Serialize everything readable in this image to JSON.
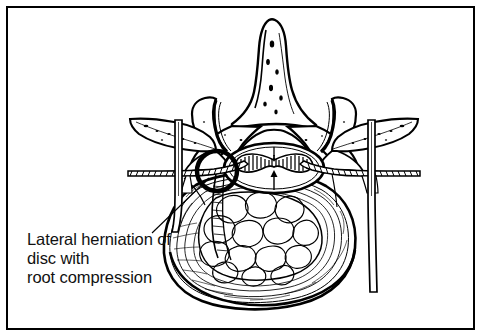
{
  "figure": {
    "domain": "medical-illustration",
    "background_color": "#ffffff",
    "ink_color": "#000000",
    "frame": {
      "present": true,
      "stroke_color": "#000000",
      "stroke_width": 2,
      "x": 7,
      "y": 7,
      "width": 467,
      "height": 322
    }
  },
  "annotation": {
    "label_lines": [
      "Lateral herniation of",
      "disc with",
      "root compression"
    ],
    "text_color": "#111111",
    "font_size_px": 16.5,
    "line_height_px": 19,
    "text_origin": {
      "x": 27,
      "y": 245
    },
    "leader_line": {
      "from": {
        "x": 152,
        "y": 233
      },
      "to": {
        "x": 209,
        "y": 178
      },
      "stroke_color": "#000000",
      "stroke_width": 1.1
    },
    "highlight_circle": {
      "center": {
        "x": 217,
        "y": 171
      },
      "radius": 20,
      "stroke_color": "#000000",
      "stroke_width": 4.5,
      "fill": "none",
      "marks": "lateral-herniation-site"
    }
  },
  "anatomy": {
    "parts": [
      {
        "name": "spinous-process",
        "label": "Spinous process",
        "position": "posterior-midline-top"
      },
      {
        "name": "lamina",
        "label": "Lamina",
        "position": "posterior-paired"
      },
      {
        "name": "superior-articular-process-left",
        "label": "Superior articular process (left)",
        "position": "posterolateral-left"
      },
      {
        "name": "superior-articular-process-right",
        "label": "Superior articular process (right)",
        "position": "posterolateral-right"
      },
      {
        "name": "transverse-process-left",
        "label": "Transverse process (left)",
        "position": "lateral-left"
      },
      {
        "name": "transverse-process-right",
        "label": "Transverse process (right)",
        "position": "lateral-right"
      },
      {
        "name": "pedicle-left",
        "label": "Pedicle (left)",
        "position": "lateral-canal-left"
      },
      {
        "name": "pedicle-right",
        "label": "Pedicle (right)",
        "position": "lateral-canal-right"
      },
      {
        "name": "vertebral-canal",
        "label": "Vertebral canal",
        "position": "central-posterior"
      },
      {
        "name": "spinal-cord-cauda-equina",
        "label": "Spinal cord / dural sac with butterfly grey matter",
        "position": "inside-vertebral-canal"
      },
      {
        "name": "nerve-root-left",
        "label": "Nerve root (left) — compressed",
        "position": "lateral-left-exiting"
      },
      {
        "name": "nerve-root-right",
        "label": "Nerve root (right)",
        "position": "lateral-right-exiting"
      },
      {
        "name": "nucleus-pulposus",
        "label": "Nucleus pulposus",
        "position": "central-disc"
      },
      {
        "name": "annulus-fibrosus",
        "label": "Annulus fibrosus",
        "position": "peripheral-disc"
      },
      {
        "name": "intervertebral-disc",
        "label": "Intervertebral disc",
        "position": "anterior"
      },
      {
        "name": "instrument-rod-left",
        "label": "Vertical instrument rod (left)",
        "position": "overlay-left"
      },
      {
        "name": "instrument-rod-right",
        "label": "Vertical instrument rod (right)",
        "position": "overlay-right"
      }
    ]
  }
}
